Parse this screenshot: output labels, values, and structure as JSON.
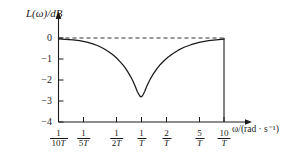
{
  "chart_data": {
    "type": "line",
    "title": "",
    "xlabel": "ω/(rad · s⁻¹)",
    "ylabel": "L(ω)/dB",
    "xscale": "log",
    "xlim": [
      0.1,
      10
    ],
    "ylim": [
      -4,
      0.35
    ],
    "grid": false,
    "legend": null,
    "yticks": [
      "0",
      "−1",
      "−2",
      "−3",
      "−4"
    ],
    "ytick_values": [
      0,
      -1,
      -2,
      -3,
      -4
    ],
    "xtick_values": [
      0.1,
      0.2,
      0.5,
      1,
      2,
      5,
      10
    ],
    "xticks": [
      {
        "num": "1",
        "den_coeff": "10",
        "den_sym": "T"
      },
      {
        "num": "1",
        "den_coeff": "5",
        "den_sym": "T"
      },
      {
        "num": "1",
        "den_coeff": "2",
        "den_sym": "T"
      },
      {
        "num": "1",
        "den_coeff": "",
        "den_sym": "T"
      },
      {
        "num": "2",
        "den_coeff": "",
        "den_sym": "T"
      },
      {
        "num": "5",
        "den_coeff": "",
        "den_sym": "T"
      },
      {
        "num": "10",
        "den_coeff": "",
        "den_sym": "T"
      }
    ],
    "reference_line": {
      "y": 0,
      "style": "dashed",
      "label": "0 dB"
    },
    "series": [
      {
        "name": "L(ω)",
        "color": "#1a1a1a",
        "x": [
          0.1,
          0.12,
          0.15,
          0.18,
          0.22,
          0.26,
          0.3,
          0.35,
          0.4,
          0.45,
          0.5,
          0.55,
          0.6,
          0.65,
          0.7,
          0.75,
          0.8,
          0.85,
          0.9,
          0.94,
          0.97,
          1.0,
          1.03,
          1.06,
          1.1,
          1.15,
          1.22,
          1.3,
          1.4,
          1.55,
          1.7,
          1.9,
          2.1,
          2.4,
          2.8,
          3.3,
          4.0,
          5.0,
          6.5,
          8.0,
          10.0
        ],
        "y": [
          -0.04,
          -0.06,
          -0.09,
          -0.13,
          -0.2,
          -0.28,
          -0.37,
          -0.5,
          -0.64,
          -0.79,
          -0.94,
          -1.11,
          -1.28,
          -1.46,
          -1.66,
          -1.86,
          -2.08,
          -2.32,
          -2.57,
          -2.7,
          -2.78,
          -2.8,
          -2.76,
          -2.68,
          -2.55,
          -2.36,
          -2.13,
          -1.92,
          -1.71,
          -1.46,
          -1.26,
          -1.07,
          -0.92,
          -0.75,
          -0.58,
          -0.44,
          -0.32,
          -0.21,
          -0.13,
          -0.09,
          -0.05
        ]
      }
    ],
    "annotations": [
      {
        "kind": "minimum",
        "x_label": "1/T",
        "y": -2.8
      },
      {
        "kind": "vertical-closing-line",
        "x_label": "10/T",
        "from_y": -4,
        "to_y": 0
      }
    ]
  }
}
